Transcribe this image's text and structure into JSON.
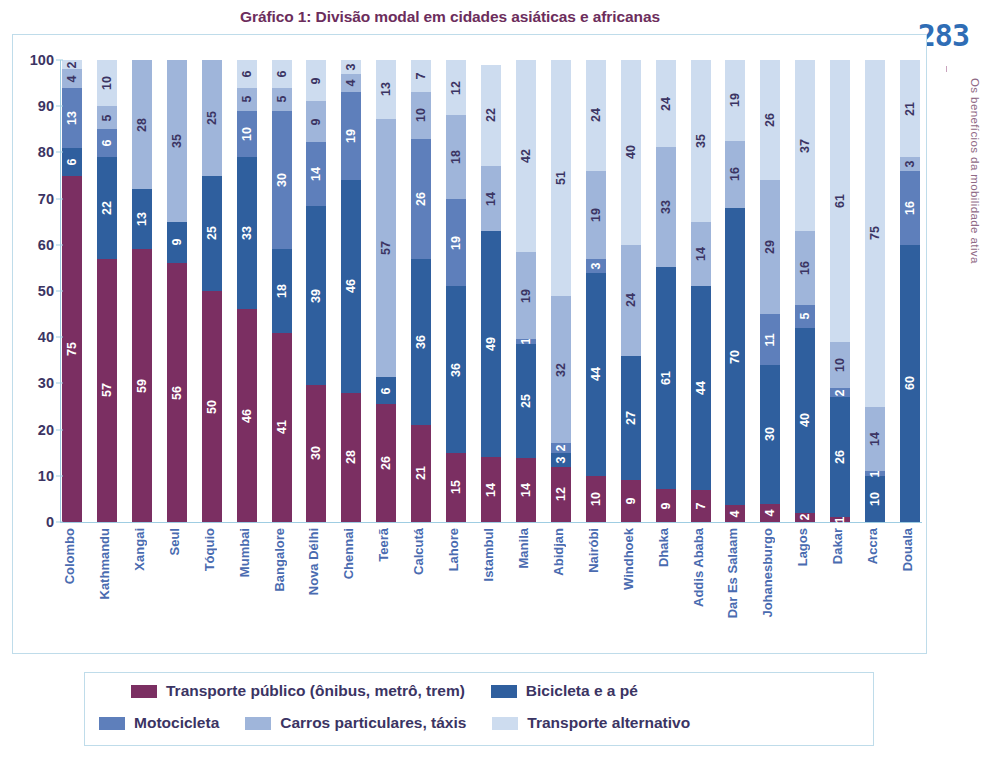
{
  "page": {
    "number": "283",
    "side_text": "Os benefícios da mobilidade ativa"
  },
  "title": "Gráfico 1: Divisão modal em cidades asiáticas e africanas",
  "legend": {
    "row1": [
      {
        "label": "Transporte público (ônibus, metrô, trem)",
        "color": "#7b2f62"
      },
      {
        "label": "Bicicleta e a pé",
        "color": "#2f5f9e"
      }
    ],
    "row2": [
      {
        "label": "Motocicleta",
        "color": "#5e7fbb"
      },
      {
        "label": "Carros particulares, táxis",
        "color": "#9fb5da"
      },
      {
        "label": "Transporte alternativo",
        "color": "#cddcef"
      }
    ]
  },
  "chart_data": {
    "type": "bar",
    "stacked": true,
    "title": "Gráfico 1: Divisão modal em cidades asiáticas e africanas",
    "xlabel": "",
    "ylabel": "",
    "ylim": [
      0,
      100
    ],
    "yticks": [
      0,
      10,
      20,
      30,
      40,
      50,
      60,
      70,
      80,
      90,
      100
    ],
    "grid": false,
    "legend_position": "bottom",
    "series_colors": {
      "Transporte público (ônibus, metrô, trem)": "#7b2f62",
      "Bicicleta e a pé": "#2f5f9e",
      "Motocicleta": "#5e7fbb",
      "Carros particulares, táxis": "#9fb5da",
      "Transporte alternativo": "#cddcef"
    },
    "categories": [
      "Colombo",
      "Kathmandu",
      "Xangai",
      "Seul",
      "Tóquio",
      "Mumbai",
      "Bangalore",
      "Nova Délhi",
      "Chennai",
      "Teerã",
      "Calcutá",
      "Lahore",
      "Istambul",
      "Manila",
      "Abidjan",
      "Nairóbi",
      "Windhoek",
      "Dhaka",
      "Addis Ababa",
      "Dar Es Salaam",
      "Johanesburgo",
      "Lagos",
      "Dakar",
      "Accra",
      "Douala"
    ],
    "series": [
      {
        "name": "Transporte público (ônibus, metrô, trem)",
        "values": [
          75,
          57,
          59,
          56,
          50,
          46,
          41,
          30,
          28,
          26,
          21,
          15,
          14,
          14,
          12,
          10,
          9,
          9,
          7,
          4,
          4,
          2,
          1,
          0,
          0
        ]
      },
      {
        "name": "Bicicleta e a pé",
        "values": [
          6,
          22,
          13,
          9,
          25,
          33,
          18,
          39,
          46,
          6,
          36,
          36,
          49,
          25,
          3,
          44,
          27,
          61,
          44,
          70,
          30,
          40,
          26,
          10,
          60
        ]
      },
      {
        "name": "Motocicleta",
        "values": [
          13,
          6,
          0,
          0,
          0,
          10,
          30,
          14,
          19,
          0,
          26,
          19,
          0,
          1,
          2,
          3,
          0,
          0,
          0,
          0,
          11,
          5,
          2,
          1,
          16
        ]
      },
      {
        "name": "Carros particulares, táxis",
        "values": [
          4,
          5,
          28,
          35,
          25,
          5,
          5,
          9,
          4,
          57,
          10,
          18,
          14,
          19,
          32,
          19,
          24,
          33,
          14,
          16,
          29,
          16,
          10,
          14,
          3
        ]
      },
      {
        "name": "Transporte alternativo",
        "values": [
          2,
          10,
          0,
          0,
          0,
          6,
          6,
          9,
          3,
          13,
          7,
          12,
          22,
          42,
          51,
          24,
          40,
          24,
          35,
          19,
          26,
          37,
          61,
          75,
          21
        ]
      }
    ]
  }
}
